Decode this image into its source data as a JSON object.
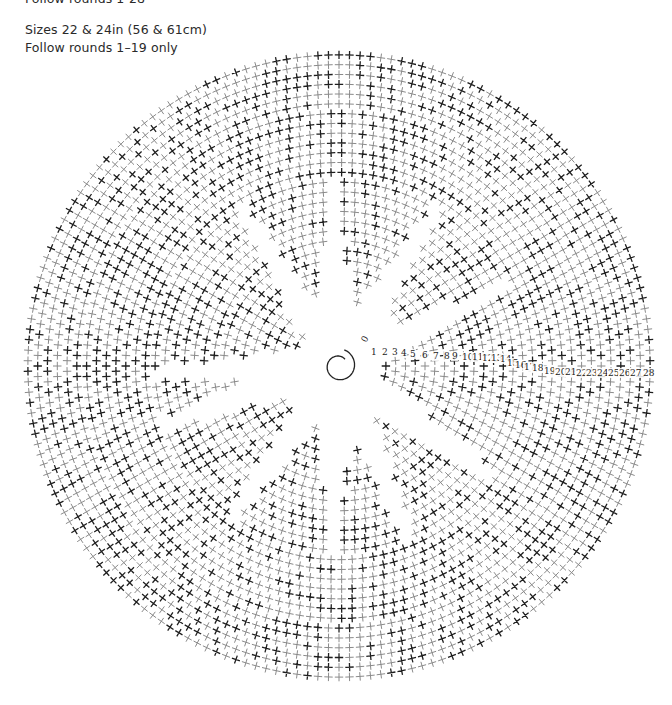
{
  "header": {
    "cut_line": "Follow rounds 1-28",
    "sizes": "Sizes 22 & 24in (56 & 61cm)",
    "follow": "Follow rounds 1–19 only"
  },
  "diagram": {
    "type": "crochet-chart-in-the-round",
    "center": [
      339,
      366
    ],
    "start_symbol": "magic-ring-spiral",
    "rounds": 28,
    "outer_radius": 316,
    "inner_radius": 42,
    "gap_angles_deg": [
      25,
      58,
      92,
      122,
      182,
      198,
      235,
      268,
      292,
      325
    ],
    "stitch_symbol": "single-crochet-cross",
    "colors": {
      "dark": "#1e1e1e",
      "light": "#8a8a8a"
    },
    "round_labels": [
      {
        "t": "0",
        "x": 366,
        "y": 343,
        "rot": -60
      },
      {
        "t": "1",
        "x": 371,
        "y": 355
      },
      {
        "t": "2",
        "x": 382,
        "y": 355
      },
      {
        "t": "3",
        "x": 392,
        "y": 355
      },
      {
        "t": "4",
        "x": 401,
        "y": 356
      },
      {
        "t": "5",
        "x": 410,
        "y": 357
      },
      {
        "t": "6",
        "x": 422,
        "y": 358
      },
      {
        "t": "7",
        "x": 433,
        "y": 359
      },
      {
        "t": "8",
        "x": 444,
        "y": 359
      },
      {
        "t": "9",
        "x": 452,
        "y": 359
      },
      {
        "t": "10",
        "x": 462,
        "y": 360
      },
      {
        "t": "11",
        "x": 472,
        "y": 360
      },
      {
        "t": "12",
        "x": 482,
        "y": 361
      },
      {
        "t": "13",
        "x": 491,
        "y": 361
      },
      {
        "t": "14",
        "x": 500,
        "y": 362
      },
      {
        "t": "15",
        "x": 507,
        "y": 366
      },
      {
        "t": "16",
        "x": 515,
        "y": 368
      },
      {
        "t": "17",
        "x": 524,
        "y": 370
      },
      {
        "t": "18",
        "x": 532,
        "y": 371
      },
      {
        "t": "19",
        "x": 544,
        "y": 374
      },
      {
        "t": "20",
        "x": 555,
        "y": 375
      },
      {
        "t": "21",
        "x": 565,
        "y": 375
      },
      {
        "t": "22",
        "x": 576,
        "y": 376
      },
      {
        "t": "23",
        "x": 586,
        "y": 376
      },
      {
        "t": "24",
        "x": 597,
        "y": 376
      },
      {
        "t": "25",
        "x": 608,
        "y": 376
      },
      {
        "t": "26",
        "x": 619,
        "y": 376
      },
      {
        "t": "27",
        "x": 630,
        "y": 376
      },
      {
        "t": "28",
        "x": 643,
        "y": 376
      }
    ]
  }
}
